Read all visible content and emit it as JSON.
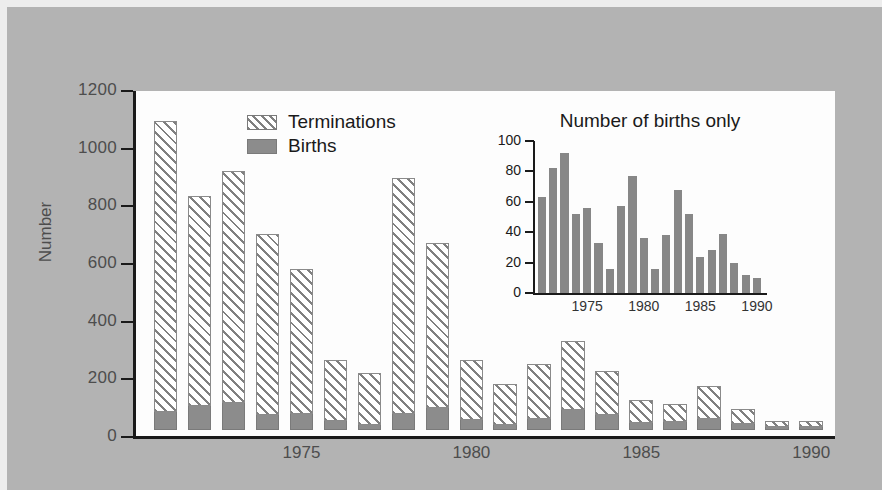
{
  "figure": {
    "background_color": "#b3b3b3",
    "plot_background_color": "#fdfdfd",
    "births_color": "#8c8c8c",
    "terminations_color": "#ffffff"
  },
  "main": {
    "ylabel": "Number",
    "ytick_labels": [
      "1200",
      "1000",
      "800",
      "600",
      "400",
      "200",
      "0"
    ],
    "xtick_labels": [
      "1975",
      "1980",
      "1985",
      "1990"
    ],
    "legend": [
      {
        "label": "Terminations",
        "swatch": "hatched"
      },
      {
        "label": "Births",
        "swatch": "solid-gray"
      }
    ]
  },
  "inset": {
    "title": "Number of births only",
    "ytick_labels": [
      "100",
      "80",
      "60",
      "40",
      "20",
      "0"
    ],
    "xtick_labels": [
      "1975",
      "1980",
      "1985",
      "1990"
    ]
  },
  "chart_data": [
    {
      "type": "bar",
      "id": "main-stacked",
      "stacked": true,
      "title": "",
      "xlabel": "",
      "ylabel": "Number",
      "ylim": [
        0,
        1200
      ],
      "ytick_values": [
        0,
        200,
        400,
        600,
        800,
        1000,
        1200
      ],
      "xtick_values": [
        1975,
        1980,
        1985,
        1990
      ],
      "grid": false,
      "legend_position": "top-center",
      "categories": [
        1971,
        1972,
        1973,
        1974,
        1975,
        1976,
        1977,
        1978,
        1979,
        1980,
        1981,
        1982,
        1983,
        1984,
        1985,
        1986,
        1987,
        1988,
        1989,
        1990
      ],
      "series": [
        {
          "name": "Births",
          "values": [
            63,
            82,
            92,
            52,
            56,
            33,
            16,
            57,
            77,
            36,
            16,
            38,
            68,
            52,
            24,
            28,
            39,
            20,
            12,
            10
          ]
        },
        {
          "name": "Terminations",
          "values": [
            1010,
            731,
            806,
            629,
            502,
            211,
            181,
            818,
            572,
            207,
            145,
            190,
            241,
            152,
            80,
            63,
            112,
            52,
            20,
            20
          ]
        }
      ],
      "totals": [
        1073,
        813,
        898,
        681,
        558,
        244,
        197,
        875,
        649,
        243,
        161,
        228,
        309,
        204,
        104,
        91,
        151,
        72,
        32,
        30
      ]
    },
    {
      "type": "bar",
      "id": "inset-births",
      "stacked": false,
      "title": "Number of births only",
      "xlabel": "",
      "ylabel": "",
      "ylim": [
        0,
        100
      ],
      "ytick_values": [
        0,
        20,
        40,
        60,
        80,
        100
      ],
      "xtick_values": [
        1975,
        1980,
        1985,
        1990
      ],
      "grid": false,
      "categories": [
        1971,
        1972,
        1973,
        1974,
        1975,
        1976,
        1977,
        1978,
        1979,
        1980,
        1981,
        1982,
        1983,
        1984,
        1985,
        1986,
        1987,
        1988,
        1989,
        1990
      ],
      "values": [
        63,
        82,
        92,
        52,
        56,
        33,
        16,
        57,
        77,
        36,
        16,
        38,
        68,
        52,
        24,
        28,
        39,
        20,
        12,
        10
      ]
    }
  ]
}
